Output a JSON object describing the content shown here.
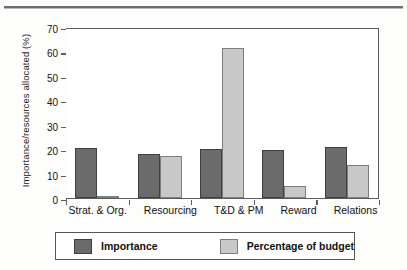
{
  "figure": {
    "has_top_rule": true,
    "background": "#fdfdfc"
  },
  "colors": {
    "series_importance": "#6b6b6b",
    "series_budget": "#c8c8c8",
    "axis": "#5d5d5d",
    "text": "#111111"
  },
  "legend": {
    "items": [
      {
        "label": "Importance",
        "color": "#6b6b6b"
      },
      {
        "label": "Percentage of budget",
        "color": "#c8c8c8"
      }
    ]
  },
  "chart_data": {
    "type": "bar",
    "title": "",
    "subtitle": "",
    "xlabel": "",
    "ylabel": "Importance/resources allocated (%)",
    "categories": [
      "Strat. & Org.",
      "Resourcing",
      "T&D & PM",
      "Reward",
      "Relations"
    ],
    "series": [
      {
        "name": "Importance",
        "values": [
          20.5,
          18,
          20,
          19.5,
          21
        ]
      },
      {
        "name": "Percentage of budget",
        "values": [
          1,
          17,
          61.5,
          5,
          13.5
        ]
      }
    ],
    "ylim": [
      0,
      70
    ],
    "yticks": [
      0,
      10,
      20,
      30,
      40,
      50,
      60,
      70
    ],
    "ytick_labels": [
      "0",
      "10",
      "20",
      "30",
      "40",
      "50",
      "60",
      "70"
    ],
    "grid": false,
    "legend_position": "bottom",
    "grouped": true
  }
}
